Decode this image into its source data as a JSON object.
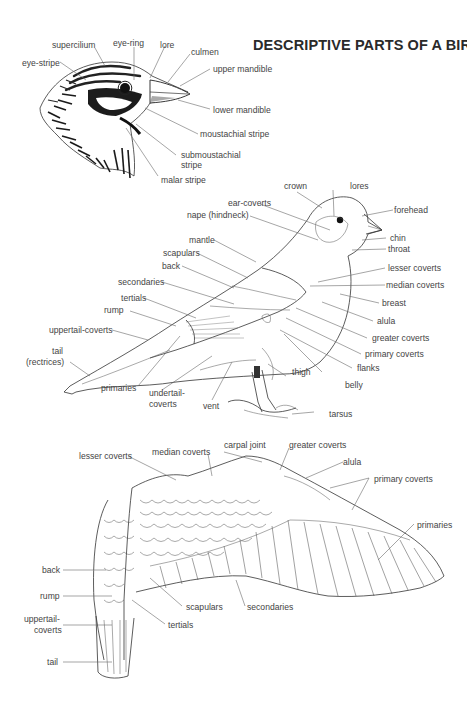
{
  "title": "DESCRIPTIVE PARTS OF A BIRD",
  "figures": {
    "head": {
      "labels": [
        {
          "id": "supercilium",
          "text": "supercilium"
        },
        {
          "id": "eye-ring",
          "text": "eye-ring"
        },
        {
          "id": "lore",
          "text": "lore"
        },
        {
          "id": "culmen",
          "text": "culmen"
        },
        {
          "id": "eye-stripe",
          "text": "eye-stripe"
        },
        {
          "id": "upper-mandible",
          "text": "upper mandible"
        },
        {
          "id": "lower-mandible",
          "text": "lower mandible"
        },
        {
          "id": "moustachial-stripe",
          "text": "moustachial stripe"
        },
        {
          "id": "submoustachial-stripe-1",
          "text": "submoustachial"
        },
        {
          "id": "submoustachial-stripe-2",
          "text": "stripe"
        },
        {
          "id": "malar-stripe",
          "text": "malar stripe"
        }
      ]
    },
    "perched_bird": {
      "labels": [
        {
          "id": "crown",
          "text": "crown"
        },
        {
          "id": "lores",
          "text": "lores"
        },
        {
          "id": "ear-coverts",
          "text": "ear-coverts"
        },
        {
          "id": "forehead",
          "text": "forehead"
        },
        {
          "id": "nape",
          "text": "nape (hindneck)"
        },
        {
          "id": "chin",
          "text": "chin"
        },
        {
          "id": "throat",
          "text": "throat"
        },
        {
          "id": "mantle",
          "text": "mantle"
        },
        {
          "id": "scapulars",
          "text": "scapulars"
        },
        {
          "id": "back",
          "text": "back"
        },
        {
          "id": "lesser-coverts",
          "text": "lesser coverts"
        },
        {
          "id": "median-coverts",
          "text": "median coverts"
        },
        {
          "id": "secondaries",
          "text": "secondaries"
        },
        {
          "id": "breast",
          "text": "breast"
        },
        {
          "id": "tertials",
          "text": "tertials"
        },
        {
          "id": "rump",
          "text": "rump"
        },
        {
          "id": "alula",
          "text": "alula"
        },
        {
          "id": "uppertail-coverts",
          "text": "uppertail-coverts"
        },
        {
          "id": "greater-coverts",
          "text": "greater coverts"
        },
        {
          "id": "tail-1",
          "text": "tail"
        },
        {
          "id": "tail-2",
          "text": "(rectrices)"
        },
        {
          "id": "primary-coverts",
          "text": "primary coverts"
        },
        {
          "id": "flanks",
          "text": "flanks"
        },
        {
          "id": "primaries",
          "text": "primaries"
        },
        {
          "id": "thigh",
          "text": "thigh"
        },
        {
          "id": "belly",
          "text": "belly"
        },
        {
          "id": "undertail-coverts-1",
          "text": "undertail-"
        },
        {
          "id": "undertail-coverts-2",
          "text": "coverts"
        },
        {
          "id": "vent",
          "text": "vent"
        },
        {
          "id": "tarsus",
          "text": "tarsus"
        }
      ]
    },
    "flying_bird": {
      "labels": [
        {
          "id": "lesser-coverts",
          "text": "lesser coverts"
        },
        {
          "id": "median-coverts",
          "text": "median coverts"
        },
        {
          "id": "carpal-joint",
          "text": "carpal joint"
        },
        {
          "id": "greater-coverts",
          "text": "greater coverts"
        },
        {
          "id": "alula",
          "text": "alula"
        },
        {
          "id": "primary-coverts",
          "text": "primary coverts"
        },
        {
          "id": "primaries",
          "text": "primaries"
        },
        {
          "id": "back",
          "text": "back"
        },
        {
          "id": "rump",
          "text": "rump"
        },
        {
          "id": "uppertail-coverts-1",
          "text": "uppertail-"
        },
        {
          "id": "uppertail-coverts-2",
          "text": "coverts"
        },
        {
          "id": "scapulars",
          "text": "scapulars"
        },
        {
          "id": "secondaries",
          "text": "secondaries"
        },
        {
          "id": "tertials",
          "text": "tertials"
        },
        {
          "id": "tail",
          "text": "tail"
        }
      ]
    }
  },
  "colors": {
    "ink": "#333333",
    "label": "#444444",
    "background": "#ffffff"
  }
}
